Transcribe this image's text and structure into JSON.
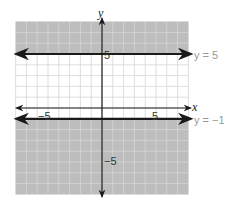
{
  "chart_data": {
    "type": "line",
    "title": "",
    "xlabel": "x",
    "ylabel": "y",
    "xlim": [
      -8,
      8
    ],
    "ylim": [
      -8,
      8
    ],
    "grid": true,
    "tick_labels": {
      "x": [
        "-5",
        "5"
      ],
      "y": [
        "5",
        "-5"
      ]
    },
    "series": [
      {
        "name": "y = 5",
        "type": "horizontal_line",
        "y": 5,
        "shade": "above"
      },
      {
        "name": "y = -1",
        "type": "horizontal_line",
        "y": -1,
        "shade": "below"
      }
    ],
    "shaded_regions": [
      {
        "description": "y >= 5",
        "y_from": 5,
        "y_to": 8
      },
      {
        "description": "y <= -1",
        "y_from": -8,
        "y_to": -1
      }
    ]
  },
  "labels": {
    "x_axis": "x",
    "y_axis": "y",
    "x_tick_neg": "−5",
    "x_tick_pos": "5",
    "y_tick_pos": "5",
    "y_tick_neg": "−5",
    "line1": "y = 5",
    "line2": "y = −1"
  },
  "colors": {
    "shade": "#bdbdbd",
    "grid": "#d6d6d6",
    "line": "#1a1a1a",
    "equation_text": "#999999"
  }
}
